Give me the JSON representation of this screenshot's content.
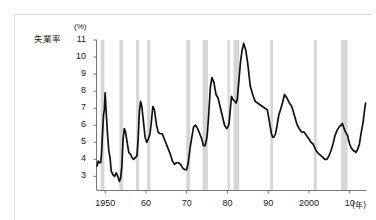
{
  "card": {
    "background": "#ffffff",
    "border_color": "#dcdcdc"
  },
  "chart_data": {
    "type": "line",
    "title": "",
    "series_label": "失業率",
    "ylabel_unit": "(%)",
    "xlabel_unit": "(年)",
    "xlabel": "",
    "ylabel": "",
    "xlim": [
      1948,
      2014
    ],
    "ylim": [
      2.2,
      11
    ],
    "grid": false,
    "legend_position": "none",
    "line_color": "#111111",
    "line_width": 1.7,
    "recession_band_color": "#d6d6d6",
    "ytick_labels": [
      "11",
      "10",
      "9",
      "8",
      "7",
      "6",
      "5",
      "4",
      "3"
    ],
    "ytick_values": [
      11,
      10,
      9,
      8,
      7,
      6,
      5,
      4,
      3
    ],
    "xtick_labels": [
      "1950",
      "60",
      "70",
      "80",
      "90",
      "2000",
      "10"
    ],
    "xtick_values": [
      1950,
      1960,
      1970,
      1980,
      1990,
      2000,
      2010
    ],
    "recession_bands": [
      {
        "start": 1948.9,
        "end": 1949.8
      },
      {
        "start": 1953.5,
        "end": 1954.4
      },
      {
        "start": 1957.6,
        "end": 1958.3
      },
      {
        "start": 1960.3,
        "end": 1961.1
      },
      {
        "start": 1969.9,
        "end": 1970.9
      },
      {
        "start": 1973.9,
        "end": 1975.2
      },
      {
        "start": 1980.0,
        "end": 1980.5
      },
      {
        "start": 1981.5,
        "end": 1982.9
      },
      {
        "start": 1990.5,
        "end": 1991.2
      },
      {
        "start": 2001.2,
        "end": 2001.9
      },
      {
        "start": 2007.9,
        "end": 2009.5
      }
    ],
    "x": [
      1948.0,
      1948.3,
      1948.6,
      1948.9,
      1949.1,
      1949.3,
      1949.6,
      1949.8,
      1950.0,
      1950.3,
      1950.6,
      1950.9,
      1951.2,
      1951.5,
      1951.9,
      1952.3,
      1952.7,
      1953.1,
      1953.5,
      1953.8,
      1954.1,
      1954.4,
      1954.7,
      1955.0,
      1955.4,
      1955.8,
      1956.2,
      1956.6,
      1957.0,
      1957.4,
      1957.8,
      1958.1,
      1958.4,
      1958.7,
      1959.0,
      1959.4,
      1959.8,
      1960.2,
      1960.6,
      1961.0,
      1961.3,
      1961.7,
      1962.1,
      1962.6,
      1963.0,
      1963.5,
      1964.0,
      1964.5,
      1965.0,
      1965.5,
      1966.0,
      1966.5,
      1967.0,
      1967.5,
      1968.0,
      1968.5,
      1969.0,
      1969.5,
      1970.0,
      1970.4,
      1970.8,
      1971.2,
      1971.7,
      1972.2,
      1972.7,
      1973.2,
      1973.7,
      1974.1,
      1974.5,
      1974.9,
      1975.1,
      1975.4,
      1975.8,
      1976.2,
      1976.7,
      1977.2,
      1977.7,
      1978.2,
      1978.8,
      1979.3,
      1979.8,
      1980.1,
      1980.4,
      1980.7,
      1981.0,
      1981.4,
      1981.8,
      1982.1,
      1982.4,
      1982.7,
      1982.95,
      1983.2,
      1983.6,
      1984.0,
      1984.5,
      1985.0,
      1985.6,
      1986.2,
      1986.8,
      1987.4,
      1988.0,
      1988.6,
      1989.2,
      1989.8,
      1990.3,
      1990.8,
      1991.1,
      1991.4,
      1991.8,
      1992.2,
      1992.6,
      1993.0,
      1993.5,
      1994.0,
      1994.6,
      1995.2,
      1995.8,
      1996.4,
      1997.0,
      1997.6,
      1998.2,
      1998.8,
      1999.4,
      2000.0,
      2000.5,
      2001.0,
      2001.4,
      2001.8,
      2002.1,
      2002.5,
      2003.0,
      2003.5,
      2003.9,
      2004.4,
      2004.9,
      2005.4,
      2005.9,
      2006.4,
      2006.9,
      2007.4,
      2007.9,
      2008.2,
      2008.5,
      2008.8,
      2009.0,
      2009.2,
      2009.5,
      2009.75,
      2010.0,
      2010.3,
      2010.6,
      2010.9,
      2011.2,
      2011.5,
      2011.8,
      2012.1,
      2012.4,
      2012.7,
      2013.0,
      2013.3,
      2013.6,
      2013.9
    ],
    "y": [
      3.6,
      3.9,
      3.8,
      3.8,
      4.3,
      5.3,
      6.6,
      6.9,
      7.9,
      6.6,
      5.4,
      4.5,
      4.1,
      3.3,
      3.1,
      3.0,
      3.2,
      3.0,
      2.7,
      2.9,
      3.6,
      5.2,
      5.8,
      5.6,
      5.0,
      4.4,
      4.3,
      4.1,
      4.0,
      4.1,
      4.2,
      5.2,
      6.8,
      7.4,
      7.1,
      6.2,
      5.3,
      5.0,
      5.2,
      5.5,
      6.1,
      7.1,
      6.9,
      6.0,
      5.6,
      5.5,
      5.5,
      5.2,
      4.9,
      4.6,
      4.3,
      3.9,
      3.7,
      3.8,
      3.8,
      3.7,
      3.5,
      3.4,
      3.4,
      3.8,
      4.6,
      5.2,
      5.9,
      6.0,
      5.8,
      5.5,
      5.2,
      4.8,
      4.8,
      5.2,
      5.6,
      6.6,
      8.2,
      8.8,
      8.5,
      7.8,
      7.6,
      7.1,
      6.5,
      6.0,
      5.8,
      5.9,
      6.1,
      6.9,
      7.7,
      7.5,
      7.4,
      7.3,
      7.5,
      8.3,
      9.0,
      9.7,
      10.4,
      10.8,
      10.4,
      9.6,
      8.3,
      7.8,
      7.4,
      7.3,
      7.2,
      7.1,
      7.0,
      6.9,
      6.2,
      5.5,
      5.3,
      5.3,
      5.5,
      6.0,
      6.6,
      6.9,
      7.3,
      7.8,
      7.6,
      7.3,
      7.1,
      6.6,
      6.1,
      5.8,
      5.6,
      5.6,
      5.4,
      5.2,
      5.0,
      4.9,
      4.7,
      4.5,
      4.4,
      4.3,
      4.2,
      4.1,
      4.0,
      4.0,
      4.2,
      4.5,
      4.9,
      5.4,
      5.7,
      5.9,
      6.0,
      6.1,
      5.9,
      5.7,
      5.6,
      5.5,
      5.4,
      5.1,
      4.9,
      4.7,
      4.6,
      4.5,
      4.5,
      4.4,
      4.5,
      4.7,
      4.9,
      5.4,
      5.8,
      6.2,
      6.8,
      7.3,
      8.1,
      8.7,
      9.4,
      9.8,
      9.9,
      10.0,
      9.8,
      9.7,
      9.6,
      9.4,
      9.5,
      9.8,
      9.4,
      9.1,
      9.0,
      9.1,
      8.9,
      8.7,
      8.5,
      8.3,
      8.2,
      8.2,
      8.1,
      7.9,
      7.8,
      7.6,
      7.5,
      7.3,
      7.2,
      6.9,
      6.7,
      6.6
    ]
  }
}
